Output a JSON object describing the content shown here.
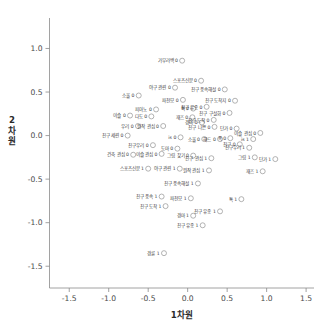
{
  "chart_data": {
    "type": "scatter",
    "title": "",
    "xlabel": "1차원",
    "ylabel": "2차원",
    "xlim": [
      -1.75,
      1.6
    ],
    "ylim": [
      -1.75,
      1.35
    ],
    "xticks": [
      "-1.5",
      "-1.0",
      "-0.5",
      "0.0",
      "0.5",
      "1.0",
      "1.5"
    ],
    "xtick_values": [
      -1.5,
      -1.0,
      -0.5,
      0.0,
      0.5,
      1.0,
      1.5
    ],
    "yticks": [
      "1.0",
      "0.5",
      "0.0",
      "-0.5",
      "-1.0",
      "-1.5"
    ],
    "ytick_values": [
      1.0,
      0.5,
      0.0,
      -0.5,
      -1.0,
      -1.5
    ],
    "grid": false,
    "legend": "none",
    "marker": "open-circle",
    "marker_color": "#9a9a9a",
    "label_color": "#3c3c3c",
    "axis_color": "#8a8a8a",
    "points": [
      {
        "label": "가부라백 0",
        "x": -0.07,
        "y": 0.86
      },
      {
        "label": "스포츠신문 0",
        "x": 0.17,
        "y": 0.63
      },
      {
        "label": "야구 관련 0",
        "x": -0.16,
        "y": 0.55
      },
      {
        "label": "친구 풍속해설 0",
        "x": 0.47,
        "y": 0.53
      },
      {
        "label": "소울 0",
        "x": -0.62,
        "y": 0.46
      },
      {
        "label": "파천모 0",
        "x": -0.06,
        "y": 0.41
      },
      {
        "label": "친구 도착지 0",
        "x": 0.6,
        "y": 0.4
      },
      {
        "label": "친구 유종 0",
        "x": 0.24,
        "y": 0.33
      },
      {
        "label": "피아노 0",
        "x": -0.4,
        "y": 0.3
      },
      {
        "label": "톡 0",
        "x": 0.07,
        "y": 0.31
      },
      {
        "label": "친구 구설화 0",
        "x": 0.53,
        "y": 0.26
      },
      {
        "label": "이슬 0",
        "x": -0.73,
        "y": 0.23
      },
      {
        "label": "다도 0",
        "x": -0.46,
        "y": 0.22
      },
      {
        "label": "재즈 0",
        "x": 0.06,
        "y": 0.21
      },
      {
        "label": "친구 도착 0",
        "x": 0.33,
        "y": 0.18
      },
      {
        "label": "경마 0",
        "x": 0.18,
        "y": 0.15
      },
      {
        "label": "우리 0",
        "x": -0.63,
        "y": 0.11
      },
      {
        "label": "원작 관심 0",
        "x": -0.31,
        "y": 0.11
      },
      {
        "label": "친구 나쁜 0",
        "x": 0.34,
        "y": 0.1
      },
      {
        "label": "단가 0",
        "x": 0.62,
        "y": 0.08
      },
      {
        "label": "이슬 관심 0",
        "x": 0.92,
        "y": 0.03
      },
      {
        "label": "친구 세련 0",
        "x": -0.76,
        "y": 0.0
      },
      {
        "label": "is 0",
        "x": -0.09,
        "y": -0.02
      },
      {
        "label": "소울 0",
        "x": 0.21,
        "y": -0.04
      },
      {
        "label": "해드 0",
        "x": 0.41,
        "y": -0.04
      },
      {
        "label": "폭 0",
        "x": 0.54,
        "y": -0.03
      },
      {
        "label": "is 1",
        "x": 0.83,
        "y": -0.04
      },
      {
        "label": "친구우리 0",
        "x": -0.44,
        "y": -0.11
      },
      {
        "label": "친구 0",
        "x": 0.66,
        "y": -0.1
      },
      {
        "label": "도마 0",
        "x": -0.13,
        "y": -0.15
      },
      {
        "label": "건축 관심 0",
        "x": -0.69,
        "y": -0.22
      },
      {
        "label": "이슬 관심 0",
        "x": -0.33,
        "y": -0.21
      },
      {
        "label": "그림 찾기 0",
        "x": 0.07,
        "y": -0.23
      },
      {
        "label": "친구 관심 1",
        "x": 0.3,
        "y": -0.26
      },
      {
        "label": "그림 1",
        "x": 0.85,
        "y": -0.25
      },
      {
        "label": "단가 1",
        "x": 1.11,
        "y": -0.27
      },
      {
        "label": "친구우리 1",
        "x": 0.78,
        "y": -0.14
      },
      {
        "label": "스포츠신문 1",
        "x": -0.5,
        "y": -0.38
      },
      {
        "label": "야구 관련 1",
        "x": -0.1,
        "y": -0.38
      },
      {
        "label": "원작 관심 1",
        "x": 0.27,
        "y": -0.4
      },
      {
        "label": "재즈 1",
        "x": 0.95,
        "y": -0.41
      },
      {
        "label": "친구 풍속해설 1",
        "x": 0.13,
        "y": -0.55
      },
      {
        "label": "친구 풍속 1",
        "x": -0.33,
        "y": -0.7
      },
      {
        "label": "파천모 1",
        "x": 0.04,
        "y": -0.72
      },
      {
        "label": "톡 1",
        "x": 0.68,
        "y": -0.73
      },
      {
        "label": "친구 도착 1",
        "x": -0.28,
        "y": -0.81
      },
      {
        "label": "친구 유종 1",
        "x": 0.41,
        "y": -0.87
      },
      {
        "label": "경마 1",
        "x": 0.07,
        "y": -0.92
      },
      {
        "label": "친구 유종 1",
        "x": 0.19,
        "y": -1.03
      },
      {
        "label": "경륜 1",
        "x": -0.3,
        "y": -1.35
      }
    ]
  }
}
